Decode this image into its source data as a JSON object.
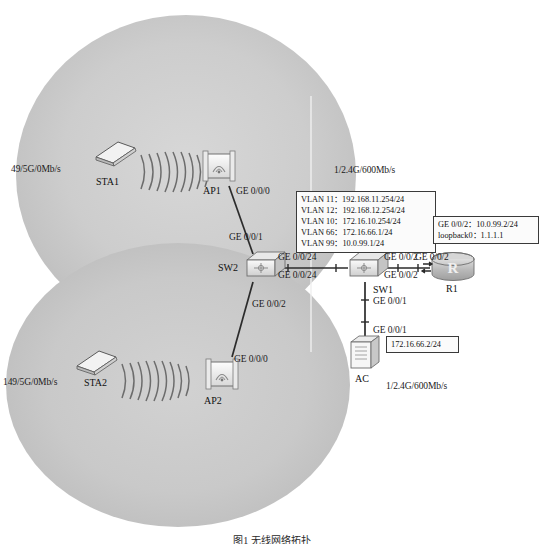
{
  "diagram": {
    "caption": "图1  无线网络拓扑",
    "background_color": "#ffffff",
    "ellipse_color": "#c9c9c9",
    "line_color": "#2b2b2b",
    "coverage_zones": [
      {
        "name": "upper-wlan-coverage",
        "label": ""
      },
      {
        "name": "lower-wlan-coverage",
        "label": ""
      }
    ]
  },
  "stations": [
    {
      "id": "sta1",
      "name": "STA1",
      "signal_label": "49/5G/0Mb/s",
      "icon": "laptop-icon"
    },
    {
      "id": "sta2",
      "name": "STA2",
      "signal_label": "149/5G/0Mb/s",
      "icon": "laptop-icon"
    }
  ],
  "access_points": [
    {
      "id": "ap1",
      "name": "AP1",
      "icon": "access-point-icon",
      "uplink_port": "GE 0/0/0",
      "rate_label": "1/2.4G/600Mb/s"
    },
    {
      "id": "ap2",
      "name": "AP2",
      "icon": "access-point-icon",
      "uplink_port": "GE 0/0/0"
    }
  ],
  "switches": [
    {
      "id": "sw2",
      "name": "SW2",
      "icon": "switch-icon",
      "ports": {
        "to_ap1": "GE 0/0/1",
        "to_ap2": "GE 0/0/2",
        "to_sw1": "GE 0/0/24"
      }
    },
    {
      "id": "sw1",
      "name": "SW1",
      "icon": "switch-icon",
      "ports": {
        "to_sw2": "GE 0/0/24",
        "to_r1": "GE 0/0/2",
        "to_ac": "GE 0/0/1",
        "downlink": "GE 0/0/2"
      }
    }
  ],
  "controller": {
    "id": "ac",
    "name": "AC",
    "icon": "wireless-controller-icon",
    "uplink_port": "GE 0/0/1",
    "rate_label": "1/2.4G/600Mb/s",
    "config": [
      "172.16.66.2/24"
    ]
  },
  "router": {
    "id": "r1",
    "name": "R1",
    "icon": "router-icon",
    "glyph": "R",
    "port_label": "GE 0/0/2",
    "config": [
      "GE 0/0/2：10.0.99.2/24",
      "loopback0：1.1.1.1"
    ]
  },
  "vlan_table": {
    "name": "vlan-config-box",
    "rows": [
      "VLAN 11：192.168.11.254/24",
      "VLAN 12：192.168.12.254/24",
      "VLAN 10：172.16.10.254/24",
      "VLAN 66：172.16.66.1/24",
      "VLAN 99：10.0.99.1/24"
    ]
  },
  "link_labels": {
    "ap1_port": "GE 0/0/0",
    "sw2_to_ap1": "GE 0/0/1",
    "sw2_to_sw1": "GE 0/0/24",
    "sw1_to_sw2": "GE 0/0/24",
    "sw2_to_ap2": "GE 0/0/2",
    "ap2_port": "GE 0/0/0",
    "sw1_to_r1": "GE 0/0/2",
    "sw1_down": "GE 0/0/2",
    "sw1_to_ac": "GE 0/0/1",
    "ac_port": "GE 0/0/1",
    "r1_port": "GE 0/0/2"
  }
}
